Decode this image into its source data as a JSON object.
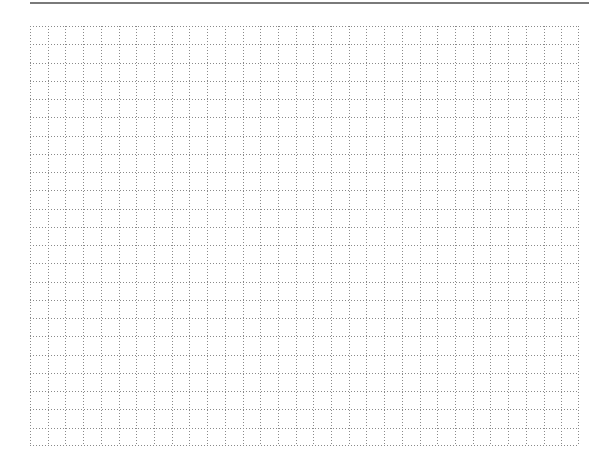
{
  "page": {
    "type": "blank graph paper",
    "top_rule": {
      "color": "#7a7a7a"
    },
    "grid": {
      "columns": 31,
      "rows": 23,
      "line_style": "dotted",
      "line_color": "#8a8a8a",
      "background": "#ffffff"
    }
  }
}
